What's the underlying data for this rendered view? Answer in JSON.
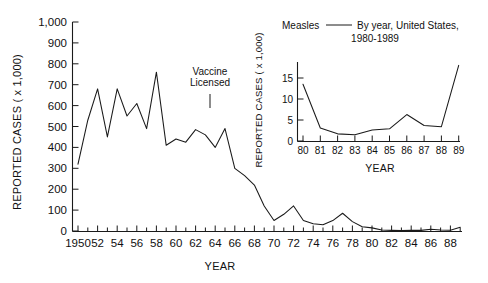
{
  "figure": {
    "background": "#ffffff",
    "line_color": "#1a1a1a",
    "axis_color": "#1a1a1a"
  },
  "main": {
    "ylabel": "REPORTED CASES ( x 1,000)",
    "xlabel": "YEAR",
    "annotation_line1": "Vaccine",
    "annotation_line2": "Licensed",
    "annotation_year": 1963,
    "y_ticks": [
      "0",
      "100",
      "200",
      "300",
      "400",
      "500",
      "600",
      "700",
      "800",
      "900",
      "1,000"
    ],
    "x_ticks": [
      "1950",
      "52",
      "54",
      "56",
      "58",
      "60",
      "62",
      "64",
      "66",
      "68",
      "70",
      "72",
      "74",
      "76",
      "78",
      "80",
      "82",
      "84",
      "86",
      "88"
    ]
  },
  "inset": {
    "title_part1": "Measles",
    "title_dash": "—",
    "title_part2": "By year, United States,",
    "title_part3": "1980-1989",
    "ylabel": "REPORTED CASES ( x 1,000)",
    "xlabel": "YEAR",
    "y_ticks": [
      "0",
      "5",
      "10",
      "15"
    ],
    "x_ticks": [
      "80",
      "81",
      "82",
      "83",
      "84",
      "85",
      "86",
      "87",
      "88",
      "89"
    ]
  },
  "chart_data": [
    {
      "type": "line",
      "id": "main-measles-1950-1989",
      "title": "Measles — By year, United States, 1950-1989",
      "xlabel": "YEAR",
      "ylabel": "REPORTED CASES ( x 1,000)",
      "xlim": [
        1950,
        1989
      ],
      "ylim": [
        0,
        1000
      ],
      "y_tick_values": [
        0,
        100,
        200,
        300,
        400,
        500,
        600,
        700,
        800,
        900,
        1000
      ],
      "x_tick_values": [
        1950,
        1952,
        1954,
        1956,
        1958,
        1960,
        1962,
        1964,
        1966,
        1968,
        1970,
        1972,
        1974,
        1976,
        1978,
        1980,
        1982,
        1984,
        1986,
        1988
      ],
      "grid": false,
      "legend": "none",
      "annotations": [
        {
          "text": "Vaccine Licensed",
          "x": 1963,
          "y": 800,
          "marker": "vertical-tick"
        }
      ],
      "x": [
        1950,
        1951,
        1952,
        1953,
        1954,
        1955,
        1956,
        1957,
        1958,
        1959,
        1960,
        1961,
        1962,
        1963,
        1964,
        1965,
        1966,
        1967,
        1968,
        1969,
        1970,
        1971,
        1972,
        1973,
        1974,
        1975,
        1976,
        1977,
        1978,
        1979,
        1980,
        1981,
        1982,
        1983,
        1984,
        1985,
        1986,
        1987,
        1988,
        1989
      ],
      "values": [
        320,
        530,
        680,
        450,
        680,
        550,
        610,
        490,
        760,
        410,
        440,
        425,
        485,
        460,
        400,
        490,
        300,
        265,
        220,
        120,
        50,
        80,
        120,
        50,
        35,
        30,
        50,
        85,
        45,
        20,
        15,
        5,
        3,
        2,
        3,
        3,
        8,
        5,
        4,
        18
      ]
    },
    {
      "type": "line",
      "id": "inset-measles-1980-1989",
      "title": "Measles — By year, United States, 1980-1989",
      "xlabel": "YEAR",
      "ylabel": "REPORTED CASES ( x 1,000)",
      "xlim": [
        1980,
        1989
      ],
      "ylim": [
        0,
        18
      ],
      "y_tick_values": [
        0,
        5,
        10,
        15
      ],
      "x_tick_values": [
        1980,
        1981,
        1982,
        1983,
        1984,
        1985,
        1986,
        1987,
        1988,
        1989
      ],
      "grid": false,
      "legend": "none",
      "x": [
        1980,
        1981,
        1982,
        1983,
        1984,
        1985,
        1986,
        1987,
        1988,
        1989
      ],
      "values": [
        13.5,
        3.1,
        1.7,
        1.5,
        2.6,
        2.9,
        6.3,
        3.7,
        3.4,
        18.0
      ]
    }
  ]
}
